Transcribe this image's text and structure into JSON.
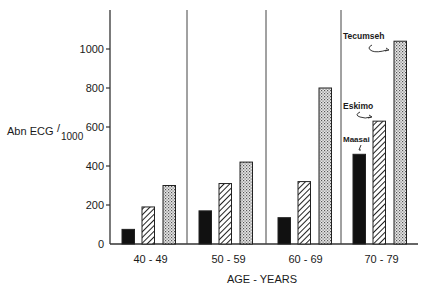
{
  "chart_data": {
    "type": "bar",
    "title": "",
    "xlabel": "AGE - YEARS",
    "ylabel": "Abn ECG/1000",
    "ylabel_main": "Abn ECG",
    "ylabel_sub": "1000",
    "ylim": [
      0,
      1200
    ],
    "yticks": [
      0,
      200,
      400,
      600,
      800,
      1000
    ],
    "grid": false,
    "categories": [
      "40 - 49",
      "50 - 59",
      "60 - 69",
      "70 - 79"
    ],
    "series": [
      {
        "name": "Maasai",
        "pattern": "solid-black",
        "values": [
          75,
          170,
          135,
          460
        ]
      },
      {
        "name": "Eskimo",
        "pattern": "diagonal-hatch",
        "values": [
          190,
          310,
          320,
          630
        ]
      },
      {
        "name": "Tecumseh",
        "pattern": "dotted",
        "values": [
          300,
          420,
          800,
          1040
        ]
      }
    ],
    "legend": {
      "position": "inline-annotations",
      "entries": [
        "Tecumseh",
        "Eskimo",
        "Maasai"
      ]
    }
  }
}
